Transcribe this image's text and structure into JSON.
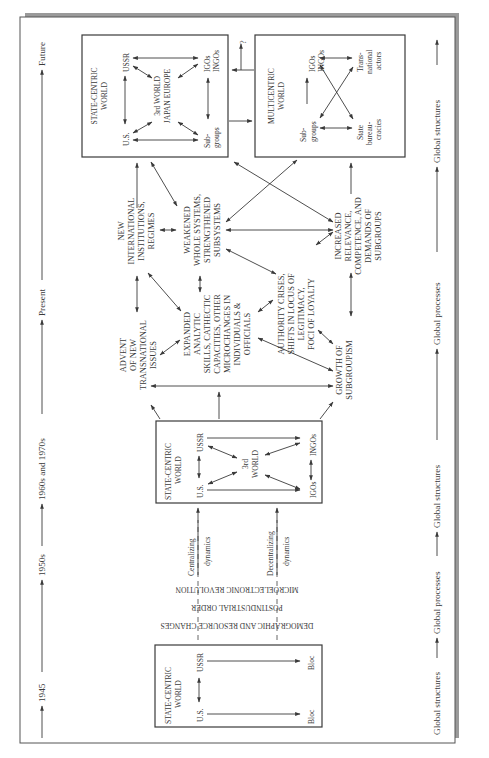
{
  "figure": {
    "orientation": "rotated 90 degrees counter-clockwise",
    "colors": {
      "ink": "#3a3a3a",
      "page": "#ffffff",
      "shadow": "#9a9a9a"
    },
    "timeline": {
      "labels": [
        "1945",
        "1950s",
        "1960s and 1970s",
        "Present",
        "Future"
      ]
    },
    "global_axis": {
      "labels": [
        "Global structures",
        "Global processes",
        "Global structures",
        "Global processes",
        "Global structures"
      ]
    },
    "box_1945": {
      "title_line1": "STATE-CENTRIC",
      "title_line2": "WORLD",
      "nodes": {
        "us": "U.S.",
        "ussr": "USSR",
        "bloc_us": "Bloc",
        "bloc_ussr": "Bloc"
      }
    },
    "drivers": {
      "line1": "MICROELECTRONIC REVOLUTION",
      "line2": "POSTINDUSTRIAL ORDER",
      "line3": "DEMOGRAPHIC AND RESOURCE CHANGES",
      "centralizing_1": "Centralizing",
      "centralizing_2": "dynamics",
      "decentralizing_1": "Decentralizing",
      "decentralizing_2": "dynamics"
    },
    "box_1960s": {
      "title_line1": "STATE-CENTRIC",
      "title_line2": "WORLD",
      "nodes": {
        "us": "U.S.",
        "ussr": "USSR",
        "third_1": "3rd",
        "third_2": "WORLD",
        "igos": "IGOs",
        "ingos": "INGOs"
      }
    },
    "present_nodes": {
      "advent": [
        "ADVENT",
        "OF NEW",
        "TRANSNATIONAL",
        "ISSUES"
      ],
      "expanded": [
        "EXPANDED",
        "ANALYTIC",
        "SKILLS, CATHECTIC",
        "CAPACITIES, OTHER",
        "MICROCHANGES IN",
        "INDIVIDUALS &",
        "OFFICIALS"
      ],
      "authority": [
        "AUTHORITY CRISES,",
        "SHIFTS IN LOCUS OF",
        "LEGITIMACY,",
        "FOCI OF LOYALTY"
      ],
      "growth": [
        "GROWTH OF",
        "SUBGROUPISM"
      ],
      "new_intl": [
        "NEW",
        "INTERNATIONAL",
        "INSTITUTIONS,",
        "REGIMES"
      ],
      "weakened": [
        "WEAKENED",
        "WHOLE SYSTEMS,",
        "STRENGTHENED",
        "SUBSYSTEMS"
      ],
      "increased": [
        "INCREASED",
        "RELEVANCE,",
        "COMPETENCE, AND",
        "DEMANDS OF",
        "SUBGROUPS"
      ]
    },
    "box_future_state": {
      "title_line1": "STATE-CENTRIC",
      "title_line2": "WORLD",
      "nodes": {
        "us": "U.S.",
        "ussr": "USSR",
        "center_1": "3rd WORLD",
        "center_2": "JAPAN EUROPE",
        "igos": "IGOs",
        "ingos": "INGOs",
        "sub_1": "Sub-",
        "sub_2": "groups"
      }
    },
    "box_future_multi": {
      "title_line1": "MULTICENTRIC",
      "title_line2": "WORLD",
      "nodes": {
        "igos": "IGOs",
        "ingos": "INGOs",
        "trans_1": "Trans-",
        "trans_2": "national",
        "trans_3": "actors",
        "sub_1": "Sub-",
        "sub_2": "groups",
        "state_1": "State",
        "state_2": "bureau-",
        "state_3": "cracies"
      }
    },
    "question_mark": "?"
  }
}
